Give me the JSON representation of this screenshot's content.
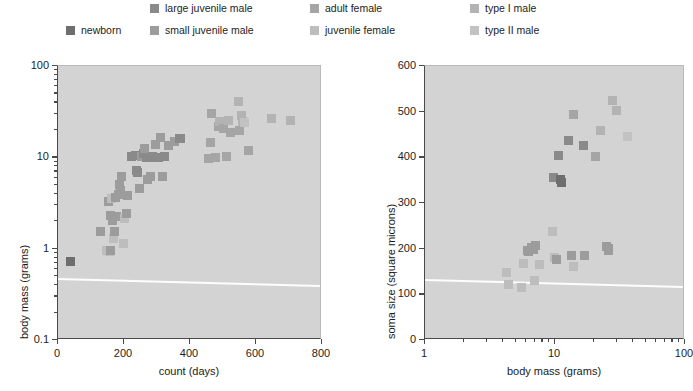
{
  "legend": {
    "items": [
      {
        "label": "large juvenile male",
        "color": "#8a8a8a",
        "row": 0,
        "col": 0
      },
      {
        "label": "newborn",
        "color": "#6e6e6e",
        "row": 1,
        "col": 0
      },
      {
        "label": "adult female",
        "color": "#a5a5a5",
        "row": 0,
        "col": 1
      },
      {
        "label": "juvenile female",
        "color": "#bdbdbd",
        "row": 1,
        "col": 1
      },
      {
        "label": "type I male",
        "color": "#b3b3b3",
        "row": 0,
        "col": 2
      },
      {
        "label": "type II male",
        "color": "#c2c2c2",
        "row": 1,
        "col": 2
      }
    ],
    "extra_label": "small juvenile male",
    "extra_color": "#9c9c9c"
  },
  "chart_data": [
    {
      "id": "left",
      "type": "scatter",
      "title": "",
      "xlabel": "count (days)",
      "ylabel": "body mass (grams)",
      "xscale": "linear",
      "yscale": "log",
      "xlim": [
        0,
        800
      ],
      "ylim": [
        0.1,
        100
      ],
      "xticks": [
        0,
        200,
        400,
        600,
        800
      ],
      "yticks": [
        0.1,
        1,
        10,
        100
      ],
      "xticklabels": [
        "0",
        "200",
        "400",
        "600",
        "800"
      ],
      "yticklabels": [
        "0.1",
        "1",
        "10",
        "100"
      ],
      "grid": false,
      "legend_position": "above-figure",
      "points": [
        {
          "x": 38,
          "y": 0.72,
          "g": "newborn"
        },
        {
          "x": 128,
          "y": 1.55,
          "g": "small juvenile male"
        },
        {
          "x": 148,
          "y": 0.95,
          "g": "juvenile female"
        },
        {
          "x": 155,
          "y": 0.93,
          "g": "juvenile female"
        },
        {
          "x": 160,
          "y": 0.96,
          "g": "small juvenile male"
        },
        {
          "x": 168,
          "y": 1.3,
          "g": "juvenile female"
        },
        {
          "x": 170,
          "y": 1.55,
          "g": "small juvenile male"
        },
        {
          "x": 165,
          "y": 2.05,
          "g": "small juvenile male"
        },
        {
          "x": 158,
          "y": 2.3,
          "g": "small juvenile male"
        },
        {
          "x": 172,
          "y": 2.25,
          "g": "small juvenile male"
        },
        {
          "x": 178,
          "y": 2.25,
          "g": "small juvenile male"
        },
        {
          "x": 152,
          "y": 3.3,
          "g": "small juvenile male"
        },
        {
          "x": 163,
          "y": 3.55,
          "g": "juvenile female"
        },
        {
          "x": 175,
          "y": 3.6,
          "g": "small juvenile male"
        },
        {
          "x": 182,
          "y": 3.95,
          "g": "small juvenile male"
        },
        {
          "x": 188,
          "y": 4.3,
          "g": "small juvenile male"
        },
        {
          "x": 186,
          "y": 5.1,
          "g": "small juvenile male"
        },
        {
          "x": 192,
          "y": 6.2,
          "g": "small juvenile male"
        },
        {
          "x": 197,
          "y": 1.15,
          "g": "juvenile female"
        },
        {
          "x": 200,
          "y": 2.15,
          "g": "juvenile female"
        },
        {
          "x": 207,
          "y": 2.4,
          "g": "small juvenile male"
        },
        {
          "x": 212,
          "y": 3.8,
          "g": "small juvenile male"
        },
        {
          "x": 222,
          "y": 10.3,
          "g": "large juvenile male"
        },
        {
          "x": 234,
          "y": 10.4,
          "g": "large juvenile male"
        },
        {
          "x": 238,
          "y": 7.1,
          "g": "large juvenile male"
        },
        {
          "x": 240,
          "y": 6.9,
          "g": "large juvenile male"
        },
        {
          "x": 246,
          "y": 4.6,
          "g": "small juvenile male"
        },
        {
          "x": 252,
          "y": 10.2,
          "g": "small juvenile male"
        },
        {
          "x": 258,
          "y": 11.0,
          "g": "large juvenile male"
        },
        {
          "x": 262,
          "y": 12.6,
          "g": "small juvenile male"
        },
        {
          "x": 268,
          "y": 9.9,
          "g": "large juvenile male"
        },
        {
          "x": 272,
          "y": 5.7,
          "g": "small juvenile male"
        },
        {
          "x": 280,
          "y": 6.1,
          "g": "small juvenile male"
        },
        {
          "x": 286,
          "y": 10.1,
          "g": "large juvenile male"
        },
        {
          "x": 292,
          "y": 10.0,
          "g": "large juvenile male"
        },
        {
          "x": 296,
          "y": 13.8,
          "g": "small juvenile male"
        },
        {
          "x": 304,
          "y": 9.9,
          "g": "large juvenile male"
        },
        {
          "x": 310,
          "y": 16.5,
          "g": "small juvenile male"
        },
        {
          "x": 318,
          "y": 6.1,
          "g": "small juvenile male"
        },
        {
          "x": 322,
          "y": 10.2,
          "g": "large juvenile male"
        },
        {
          "x": 334,
          "y": 13.6,
          "g": "small juvenile male"
        },
        {
          "x": 352,
          "y": 15.0,
          "g": "small juvenile male"
        },
        {
          "x": 368,
          "y": 16.0,
          "g": "large juvenile male"
        },
        {
          "x": 372,
          "y": 16.2,
          "g": "large juvenile male"
        },
        {
          "x": 456,
          "y": 9.6,
          "g": "adult female"
        },
        {
          "x": 462,
          "y": 14.5,
          "g": "adult female"
        },
        {
          "x": 466,
          "y": 30.0,
          "g": "adult female"
        },
        {
          "x": 478,
          "y": 9.9,
          "g": "adult female"
        },
        {
          "x": 486,
          "y": 22.0,
          "g": "adult female"
        },
        {
          "x": 490,
          "y": 24.5,
          "g": "type I male"
        },
        {
          "x": 500,
          "y": 20.5,
          "g": "adult female"
        },
        {
          "x": 512,
          "y": 10.3,
          "g": "adult female"
        },
        {
          "x": 516,
          "y": 25.5,
          "g": "type I male"
        },
        {
          "x": 524,
          "y": 18.5,
          "g": "adult female"
        },
        {
          "x": 546,
          "y": 41.0,
          "g": "type I male"
        },
        {
          "x": 550,
          "y": 19.5,
          "g": "adult female"
        },
        {
          "x": 556,
          "y": 29.0,
          "g": "type I male"
        },
        {
          "x": 560,
          "y": 24.5,
          "g": "type I male"
        },
        {
          "x": 566,
          "y": 24.0,
          "g": "type II male"
        },
        {
          "x": 576,
          "y": 12.0,
          "g": "adult female"
        },
        {
          "x": 648,
          "y": 26.5,
          "g": "type I male"
        },
        {
          "x": 706,
          "y": 25.0,
          "g": "type I male"
        }
      ]
    },
    {
      "id": "right",
      "type": "scatter",
      "title": "",
      "xlabel": "body mass (grams)",
      "ylabel": "soma size (square microns)",
      "xscale": "log",
      "yscale": "linear",
      "xlim": [
        1,
        100
      ],
      "ylim": [
        0,
        600
      ],
      "xticks": [
        1,
        10,
        100
      ],
      "yticks": [
        0,
        100,
        200,
        300,
        400,
        500,
        600
      ],
      "xticklabels": [
        "1",
        "10",
        "100"
      ],
      "yticklabels": [
        "0",
        "100",
        "200",
        "300",
        "400",
        "500",
        "600"
      ],
      "grid": false,
      "legend_position": "above-figure",
      "points": [
        {
          "x": 4.2,
          "y": 148,
          "g": "juvenile female"
        },
        {
          "x": 4.4,
          "y": 122,
          "g": "juvenile female"
        },
        {
          "x": 5.5,
          "y": 114,
          "g": "juvenile female"
        },
        {
          "x": 5.7,
          "y": 168,
          "g": "juvenile female"
        },
        {
          "x": 6.1,
          "y": 196,
          "g": "small juvenile male"
        },
        {
          "x": 6.3,
          "y": 193,
          "g": "small juvenile male"
        },
        {
          "x": 6.6,
          "y": 203,
          "g": "small juvenile male"
        },
        {
          "x": 6.8,
          "y": 199,
          "g": "small juvenile male"
        },
        {
          "x": 7.1,
          "y": 207,
          "g": "small juvenile male"
        },
        {
          "x": 6.9,
          "y": 130,
          "g": "juvenile female"
        },
        {
          "x": 7.6,
          "y": 166,
          "g": "juvenile female"
        },
        {
          "x": 9.6,
          "y": 238,
          "g": "juvenile female"
        },
        {
          "x": 9.9,
          "y": 180,
          "g": "juvenile female"
        },
        {
          "x": 10.2,
          "y": 176,
          "g": "small juvenile male"
        },
        {
          "x": 13.5,
          "y": 184,
          "g": "small juvenile male"
        },
        {
          "x": 13.8,
          "y": 162,
          "g": "juvenile female"
        },
        {
          "x": 17.0,
          "y": 186,
          "g": "small juvenile male"
        },
        {
          "x": 25.0,
          "y": 204,
          "g": "small juvenile male"
        },
        {
          "x": 25.6,
          "y": 196,
          "g": "small juvenile male"
        },
        {
          "x": 26.0,
          "y": 200,
          "g": "small juvenile male"
        },
        {
          "x": 9.8,
          "y": 356,
          "g": "large juvenile male"
        },
        {
          "x": 10.6,
          "y": 405,
          "g": "large juvenile male"
        },
        {
          "x": 11.0,
          "y": 352,
          "g": "newborn"
        },
        {
          "x": 11.2,
          "y": 345,
          "g": "newborn"
        },
        {
          "x": 12.6,
          "y": 436,
          "g": "large juvenile male"
        },
        {
          "x": 14.0,
          "y": 493,
          "g": "adult female"
        },
        {
          "x": 16.5,
          "y": 427,
          "g": "large juvenile male"
        },
        {
          "x": 20.5,
          "y": 401,
          "g": "adult female"
        },
        {
          "x": 22.5,
          "y": 458,
          "g": "type I male"
        },
        {
          "x": 27.5,
          "y": 525,
          "g": "type I male"
        },
        {
          "x": 29.5,
          "y": 502,
          "g": "type I male"
        },
        {
          "x": 36.0,
          "y": 445,
          "g": "type II male"
        }
      ]
    }
  ],
  "colors": {
    "plot_background": "#d3d3d3",
    "axis": "#4a4a4a",
    "scanline": "#fdfdfd"
  }
}
